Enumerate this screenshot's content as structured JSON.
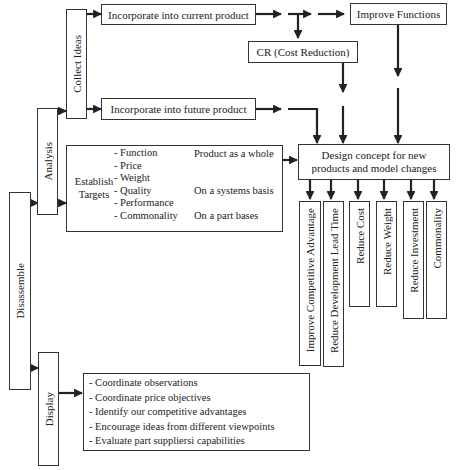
{
  "diagram": {
    "root": {
      "label": "Disassemble"
    },
    "branches": {
      "analysis": {
        "label": "Analysis"
      },
      "display": {
        "label": "Display"
      },
      "collect_ideas": {
        "label": "Collect Ideas"
      }
    },
    "current_product": {
      "label": "Incorporate into current product"
    },
    "future_product": {
      "label": "Incorporate into future product"
    },
    "improve_functions": {
      "label": "Improve Functions"
    },
    "cost_reduction": {
      "label": "CR (Cost Reduction)"
    },
    "design_concept": {
      "line1": "Design concept for new",
      "line2": "products and model changes"
    },
    "establish_targets": {
      "label_line1": "Establish",
      "label_line2": "Targets",
      "items": [
        "- Function",
        "- Price",
        "- Weight",
        "- Quality",
        "- Performance",
        "- Commonality"
      ],
      "scopes": [
        "Product as a whole",
        "On a systems basis",
        "On a part bases"
      ]
    },
    "outcomes": [
      "Improve Competitive Advantage",
      "Reduce Development Lead Time",
      "Reduce Cost",
      "Reduce Weight",
      "Reduce Investment",
      "Commonality"
    ],
    "display_items": [
      "- Coordinate observations",
      "- Coordinate price objectives",
      "- Identify our competitive advantages",
      "- Encourage ideas from different viewpoints",
      "- Evaluate part suppliersi capabilities"
    ],
    "colors": {
      "line": "#222222",
      "border": "#333333",
      "background": "#ffffff"
    }
  }
}
